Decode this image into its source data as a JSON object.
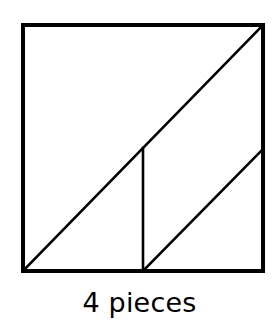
{
  "figure": {
    "caption": "4 pieces",
    "piece_count": 4,
    "shape_name": "square",
    "colors": {
      "stroke": "#000000",
      "fill": "#ffffff",
      "background": "#ffffff",
      "text": "#000000"
    },
    "stroke_widths": {
      "outer_border": 4,
      "inner_line": 2.6
    },
    "square": {
      "left": 21,
      "top": 23,
      "right": 265,
      "bottom": 273,
      "width": 244,
      "height": 250
    },
    "lines": [
      {
        "name": "main-diagonal",
        "x1": 21,
        "y1": 273,
        "x2": 265,
        "y2": 23
      },
      {
        "name": "vertical-divider",
        "x1": 143,
        "y1": 148,
        "x2": 143,
        "y2": 273
      },
      {
        "name": "lower-diagonal",
        "x1": 143,
        "y1": 273,
        "x2": 265,
        "y2": 149
      }
    ],
    "regions": [
      {
        "name": "upper-left-triangle"
      },
      {
        "name": "lower-left-triangle"
      },
      {
        "name": "middle-triangle"
      },
      {
        "name": "right-triangle"
      }
    ]
  }
}
